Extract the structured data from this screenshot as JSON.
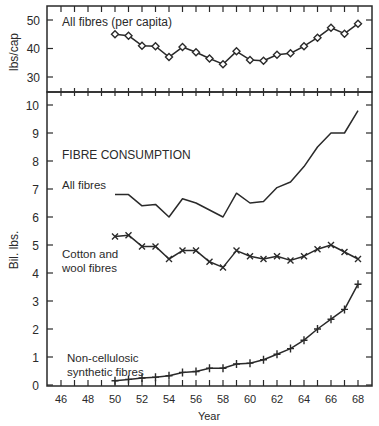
{
  "chart_data": [
    {
      "type": "line",
      "panel": "top",
      "title": "All fibres (per capita)",
      "xlabel": "",
      "ylabel": "lbs/cap",
      "ylim": [
        25,
        55
      ],
      "yticks": [
        30,
        40,
        50
      ],
      "x": [
        50,
        51,
        52,
        53,
        54,
        55,
        56,
        57,
        58,
        59,
        60,
        61,
        62,
        63,
        64,
        65,
        66,
        67,
        68
      ],
      "series": [
        {
          "name": "All fibres (per capita)",
          "marker": "diamond",
          "values": [
            45.0,
            44.5,
            41.0,
            40.8,
            37.0,
            40.5,
            38.7,
            36.5,
            34.5,
            39.0,
            36.0,
            35.7,
            37.8,
            38.3,
            40.8,
            43.8,
            47.3,
            45.2,
            48.7
          ]
        }
      ],
      "grid": false
    },
    {
      "type": "line",
      "panel": "bottom",
      "title": "FIBRE CONSUMPTION",
      "xlabel": "Year",
      "ylabel": "Bil. lbs.",
      "ylim": [
        0,
        10.5
      ],
      "yticks": [
        0,
        1,
        2,
        3,
        4,
        5,
        6,
        7,
        8,
        9,
        10
      ],
      "xlim": [
        45,
        69
      ],
      "xticks": [
        46,
        48,
        50,
        52,
        54,
        56,
        58,
        60,
        62,
        64,
        66,
        68
      ],
      "x": [
        50,
        51,
        52,
        53,
        54,
        55,
        56,
        57,
        58,
        59,
        60,
        61,
        62,
        63,
        64,
        65,
        66,
        67,
        68
      ],
      "series": [
        {
          "name": "All fibres",
          "marker": "none",
          "values": [
            6.8,
            6.8,
            6.4,
            6.45,
            6.0,
            6.65,
            6.5,
            6.25,
            6.0,
            6.85,
            6.5,
            6.55,
            7.05,
            7.25,
            7.8,
            8.5,
            9.0,
            9.0,
            9.8
          ]
        },
        {
          "name": "Cotton and wool fibres",
          "marker": "x",
          "values": [
            5.3,
            5.35,
            4.95,
            4.95,
            4.5,
            4.8,
            4.8,
            4.4,
            4.2,
            4.8,
            4.6,
            4.5,
            4.6,
            4.45,
            4.6,
            4.85,
            5.0,
            4.75,
            4.5
          ]
        },
        {
          "name": "Non-cellulosic synthetic fibres",
          "marker": "plus",
          "values": [
            0.15,
            0.2,
            0.25,
            0.28,
            0.33,
            0.45,
            0.48,
            0.6,
            0.6,
            0.75,
            0.78,
            0.9,
            1.1,
            1.3,
            1.6,
            2.0,
            2.35,
            2.7,
            3.6
          ]
        }
      ],
      "grid": false
    }
  ],
  "labels": {
    "top_title": "All fibres (per capita)",
    "top_ylabel": "lbs/cap",
    "bottom_title": "FIBRE CONSUMPTION",
    "bottom_ylabel": "Bil. lbs.",
    "xlabel": "Year",
    "series_all": "All fibres",
    "series_cotton_1": "Cotton and",
    "series_cotton_2": "wool fibres",
    "series_synth_1": "Non-cellulosic",
    "series_synth_2": "synthetic fibres"
  },
  "colors": {
    "line": "#2a2a2a",
    "frame": "#2a2a2a",
    "background": "#ffffff"
  }
}
